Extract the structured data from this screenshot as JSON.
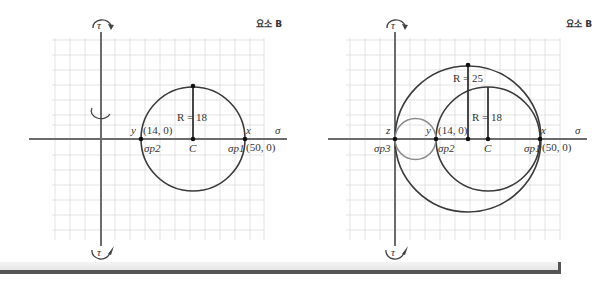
{
  "panels": [
    {
      "id": "left",
      "element_label": "요소 B",
      "axis_labels": {
        "sigma": "σ",
        "tau_top": "τ",
        "tau_bottom": "τ"
      },
      "points": {
        "y": {
          "label": "y",
          "coord": "(14, 0)",
          "sigma_label": "σp2"
        },
        "x": {
          "label": "x",
          "coord": "(50, 0)",
          "sigma_label": "σp1"
        },
        "center": {
          "label": "C"
        }
      },
      "radius_label": "R = 18"
    },
    {
      "id": "right",
      "element_label": "요소 B",
      "axis_labels": {
        "sigma": "σ",
        "tau_top": "τ",
        "tau_bottom": "τ"
      },
      "points": {
        "z": {
          "label": "z",
          "sigma_label": "σp3"
        },
        "y": {
          "label": "y",
          "coord": "(14, 0)",
          "sigma_label": "σp2"
        },
        "x": {
          "label": "x",
          "coord": "(50, 0)",
          "sigma_label": "σp1"
        },
        "center": {
          "label": "C"
        }
      },
      "radius_labels": {
        "outer": "R = 25",
        "inner": "R = 18"
      }
    }
  ],
  "colors": {
    "axis": "#6b6b6b",
    "circle": "#3a3a3a",
    "small_circle": "#8a8a8a",
    "grid": "#dcdcdc"
  }
}
